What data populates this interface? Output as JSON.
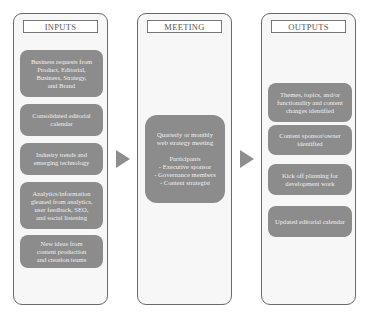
{
  "panels": {
    "inputs": {
      "title": "INPUTS",
      "items": [
        "Business requests from\nProduct, Editorial,\nBusiness, Strategy,\nand Brand",
        "Consolidated editorial\ncalendar",
        "Industry trends and\nemerging technology",
        "Analytics/information\ngleaned from analytics,\nuser feedback, SEO,\nand social listening",
        "New ideas from\ncontent production\nand creation teams"
      ]
    },
    "meeting": {
      "title": "MEETING",
      "items": [
        "Quarterly or monthly\nweb strategy meeting\n\nParticipants\n- Executive sponsor\n- Governance members\n- Content strategist"
      ]
    },
    "outputs": {
      "title": "OUTPUTS",
      "items": [
        "Themes, topics, and/or\nfunctionality and content\nchanges identified",
        "Content sponsor/owner\nidentified",
        "Kick off planning for\ndevelopment work",
        "Updated editorial calendar"
      ]
    }
  },
  "colors": {
    "box_fill": "#8c8c8c",
    "panel_fill": "#f7f7f7",
    "border": "#6a6a6a",
    "arrow": "#8e8e8e"
  }
}
